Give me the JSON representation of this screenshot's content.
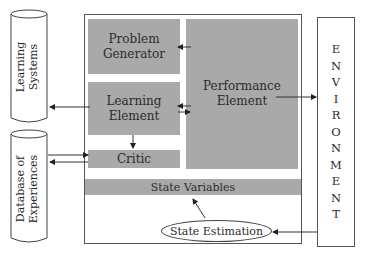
{
  "diagram": {
    "type": "learning-agent-architecture",
    "colors": {
      "box_fill": "#a9a9a9",
      "stroke": "#444444",
      "background": "#ffffff"
    },
    "external": {
      "learning_systems": {
        "line1": "Learning",
        "line2": "Systems",
        "shape": "cylinder"
      },
      "database": {
        "line1": "Database of",
        "line2": "Experiences",
        "shape": "cylinder"
      },
      "environment": {
        "letters": [
          "E",
          "N",
          "V",
          "I",
          "R",
          "O",
          "N",
          "M",
          "E",
          "N",
          "T"
        ],
        "label": "ENVIRONMENT",
        "shape": "rectangle"
      }
    },
    "agent": {
      "problem_generator": {
        "line1": "Problem",
        "line2": "Generator"
      },
      "learning_element": {
        "line1": "Learning",
        "line2": "Element"
      },
      "critic": {
        "label": "Critic"
      },
      "performance_element": {
        "line1": "Performance",
        "line2": "Element"
      },
      "state_variables": {
        "label": "State Variables"
      },
      "state_estimation": {
        "label": "State Estimation",
        "shape": "ellipse"
      }
    },
    "edges": [
      {
        "from": "Performance Element",
        "to": "Problem Generator"
      },
      {
        "from": "Performance Element",
        "to": "Learning Element"
      },
      {
        "from": "Learning Element",
        "to": "Performance Element"
      },
      {
        "from": "Learning Element",
        "to": "Learning Systems"
      },
      {
        "from": "Learning Element",
        "to": "Critic"
      },
      {
        "from": "Database of Experiences",
        "to": "Critic"
      },
      {
        "from": "Critic",
        "to": "Database of Experiences"
      },
      {
        "from": "Performance Element",
        "to": "ENVIRONMENT"
      },
      {
        "from": "ENVIRONMENT",
        "to": "State Estimation"
      },
      {
        "from": "State Estimation",
        "to": "State Variables"
      }
    ]
  }
}
